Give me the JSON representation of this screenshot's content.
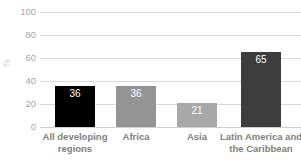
{
  "chart_data": {
    "type": "bar",
    "title": "",
    "xlabel": "",
    "ylabel": "%",
    "categories": [
      "All developing regions",
      "Africa",
      "Asia",
      "Latin America and the Caribbean"
    ],
    "values": [
      36,
      36,
      21,
      65
    ],
    "value_labels": [
      "36",
      "36",
      "21",
      "65"
    ],
    "bar_colors": [
      "#000000",
      "#949494",
      "#a8a8a8",
      "#3d3d3d"
    ],
    "ylim": [
      0,
      100
    ],
    "yticks": [
      0,
      20,
      40,
      60,
      80,
      100
    ],
    "ytick_labels": [
      "0",
      "20",
      "40",
      "60",
      "80",
      "100"
    ],
    "grid": true,
    "legend": "none"
  },
  "axis": {
    "y_title": "%",
    "y_tick_color": "#a6a6a6",
    "gridline_color": "#d9d9d9"
  },
  "labels": {
    "category_color": "#808080",
    "value_color": "#ffffff"
  }
}
